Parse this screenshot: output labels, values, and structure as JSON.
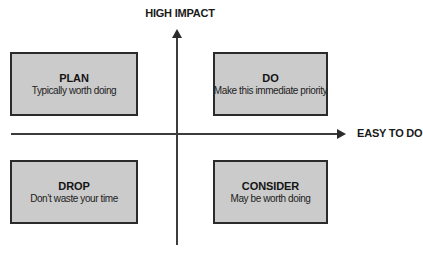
{
  "matrix": {
    "axes": {
      "vertical_label": "HIGH IMPACT",
      "horizontal_label": "EASY TO DO"
    },
    "quadrants": {
      "top_left": {
        "title": "PLAN",
        "subtitle": "Typically worth doing"
      },
      "top_right": {
        "title": "DO",
        "subtitle": "Make this immediate priority"
      },
      "bottom_left": {
        "title": "DROP",
        "subtitle": "Don’t waste your time"
      },
      "bottom_right": {
        "title": "CONSIDER",
        "subtitle": "May be worth doing"
      }
    },
    "colors": {
      "box_fill": "#cbcbcb",
      "box_border": "#2b2b2b",
      "axis_line": "#3c3c3c",
      "text": "#1a1a1a",
      "background": "#ffffff"
    }
  }
}
